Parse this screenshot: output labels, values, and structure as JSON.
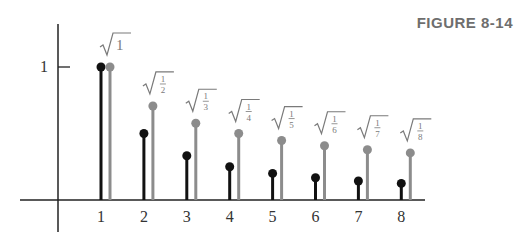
{
  "figure": {
    "title": "FIGURE 8-14"
  },
  "chart_data": {
    "type": "stem",
    "title": "FIGURE 8-14",
    "xlabel": "",
    "ylabel": "",
    "categories": [
      "1",
      "2",
      "3",
      "4",
      "5",
      "6",
      "7",
      "8"
    ],
    "x": [
      1,
      2,
      3,
      4,
      5,
      6,
      7,
      8
    ],
    "series": [
      {
        "name": "1/n",
        "color": "#111111",
        "values": [
          1,
          0.5,
          0.333,
          0.25,
          0.2,
          0.167,
          0.143,
          0.125
        ]
      },
      {
        "name": "sqrt(1/n)",
        "color": "#8c8c8c",
        "values": [
          1,
          0.707,
          0.577,
          0.5,
          0.447,
          0.408,
          0.378,
          0.354
        ],
        "annotations": [
          "√1",
          "√(1/2)",
          "√(1/3)",
          "√(1/4)",
          "√(1/5)",
          "√(1/6)",
          "√(1/7)",
          "√(1/8)"
        ]
      }
    ],
    "yticks": [
      1
    ],
    "ytick_labels": [
      "1"
    ],
    "xlim": [
      -1,
      9
    ],
    "ylim": [
      0,
      1.25
    ],
    "grid": false,
    "legend": "none"
  },
  "style": {
    "axis_color": "#222222",
    "dark_color": "#111111",
    "gray_color": "#8c8c8c",
    "label_color": "#333333",
    "annotation_color": "#7a7a7a"
  }
}
